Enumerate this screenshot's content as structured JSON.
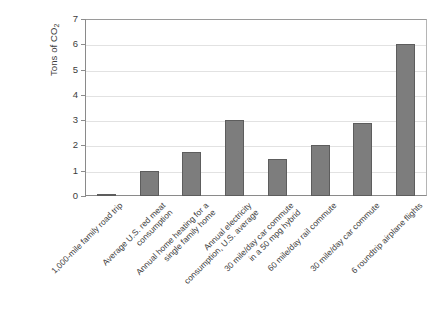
{
  "chart_data": {
    "type": "bar",
    "title": "",
    "xlabel": "",
    "ylabel": "Tons of CO",
    "ylabel_sub": "2",
    "ylim": [
      0,
      7
    ],
    "ytick_labels": [
      "0",
      "1",
      "2",
      "3",
      "4",
      "5",
      "6",
      "7"
    ],
    "ytick_values": [
      0,
      1,
      2,
      3,
      4,
      5,
      6,
      7
    ],
    "grid": true,
    "legend": "none",
    "bar_color": "#7d7d7d",
    "bar_edge_color": "#5d5d5d",
    "categories": [
      "1,000-mile family road trip",
      "Average U.S. red meat consumption",
      "Annual home heating for a single family home",
      "Annual electricity consumption, U.S. average",
      "30 mile/day car commute in a 50 mpg hybrid",
      "60 mile/day rail commute",
      "30 mile/day car commute",
      "6 roundtrip airplane flights"
    ],
    "categories_lines": [
      [
        "1,000-mile family road trip",
        ""
      ],
      [
        "Average U.S. red meat",
        "consumption"
      ],
      [
        "Annual home heating for a",
        "single family home"
      ],
      [
        "Annual electricity",
        "consumption, U.S. average"
      ],
      [
        "30 mile/day car commute",
        "in a 50 mpg hybrid"
      ],
      [
        "60 mile/day rail commute",
        ""
      ],
      [
        "30 mile/day car commute",
        ""
      ],
      [
        "6 roundtrip airplane flights",
        ""
      ]
    ],
    "values": [
      0.08,
      1.0,
      1.75,
      3.0,
      1.45,
      2.0,
      2.9,
      6.0
    ]
  }
}
